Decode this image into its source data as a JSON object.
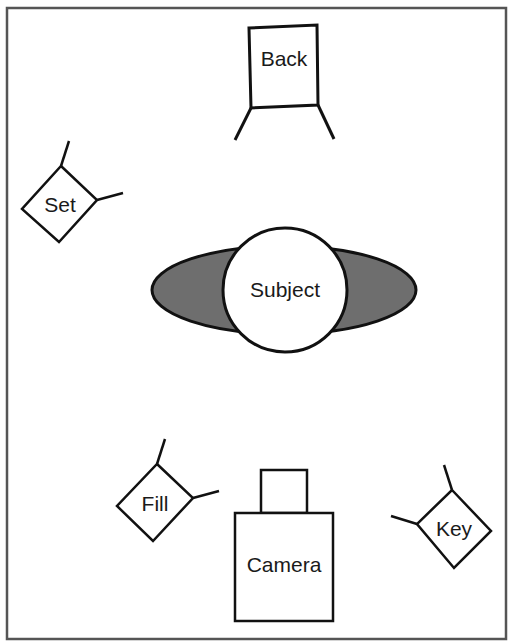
{
  "diagram": {
    "type": "lighting-setup",
    "colors": {
      "stroke": "#111111",
      "frame": "#555555",
      "fill_shadow": "#6e6e6e",
      "background": "#ffffff"
    },
    "elements": {
      "back": {
        "label": "Back"
      },
      "set": {
        "label": "Set"
      },
      "subject": {
        "label": "Subject"
      },
      "fill": {
        "label": "Fill"
      },
      "camera": {
        "label": "Camera"
      },
      "key": {
        "label": "Key"
      }
    }
  }
}
